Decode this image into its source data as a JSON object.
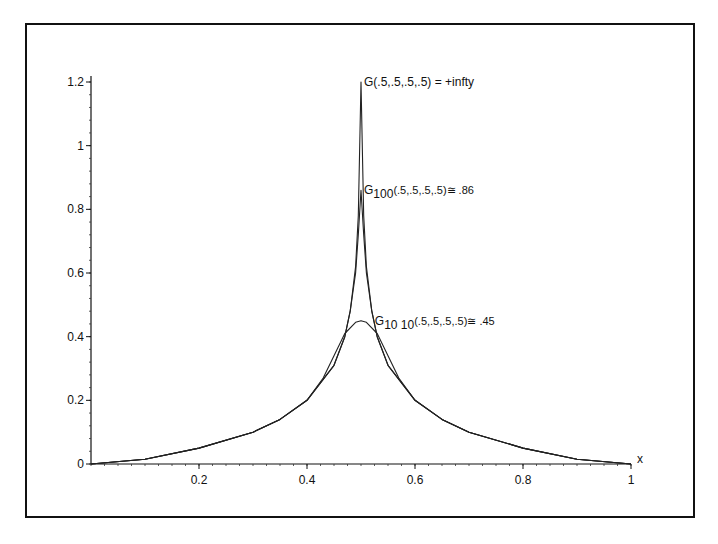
{
  "chart_data": {
    "type": "line",
    "title": "",
    "xlabel": "x",
    "ylabel": "",
    "xlim": [
      0,
      1
    ],
    "ylim": [
      0,
      1.2
    ],
    "grid": false,
    "x_ticks": [
      "0.2",
      "0.4",
      "0.6",
      "0.8",
      "1"
    ],
    "y_ticks": [
      "0",
      "0.2",
      "0.4",
      "0.6",
      "0.8",
      "1",
      "1.2"
    ],
    "annotations": [
      {
        "id": "g",
        "text": "G(.5,.5,.5,.5) = +infty",
        "x": 0.5,
        "y": 1.2
      },
      {
        "id": "g100",
        "prefix": "G",
        "sub": "100",
        "suffix": "(.5,.5,.5,.5)≅ .86",
        "x": 0.5,
        "y": 0.86
      },
      {
        "id": "g1010",
        "prefix": "G",
        "sub": "10 10",
        "suffix": "(.5,.5,.5,.5)≅ .45",
        "x": 0.52,
        "y": 0.45
      }
    ],
    "series": [
      {
        "name": "G",
        "x": [
          0,
          0.1,
          0.2,
          0.3,
          0.35,
          0.4,
          0.45,
          0.47,
          0.48,
          0.49,
          0.495,
          0.5,
          0.505,
          0.51,
          0.52,
          0.53,
          0.55,
          0.6,
          0.65,
          0.7,
          0.8,
          0.9,
          1
        ],
        "values": [
          0,
          0.015,
          0.05,
          0.1,
          0.14,
          0.2,
          0.31,
          0.4,
          0.48,
          0.62,
          0.78,
          1.2,
          0.78,
          0.62,
          0.48,
          0.4,
          0.31,
          0.2,
          0.14,
          0.1,
          0.05,
          0.015,
          0
        ]
      },
      {
        "name": "G100",
        "x": [
          0,
          0.1,
          0.2,
          0.3,
          0.35,
          0.4,
          0.45,
          0.47,
          0.48,
          0.49,
          0.495,
          0.5,
          0.505,
          0.51,
          0.52,
          0.53,
          0.55,
          0.6,
          0.65,
          0.7,
          0.8,
          0.9,
          1
        ],
        "values": [
          0,
          0.015,
          0.05,
          0.1,
          0.14,
          0.2,
          0.31,
          0.4,
          0.48,
          0.6,
          0.72,
          0.86,
          0.72,
          0.6,
          0.48,
          0.4,
          0.31,
          0.2,
          0.14,
          0.1,
          0.05,
          0.015,
          0
        ]
      },
      {
        "name": "G10 10",
        "x": [
          0,
          0.1,
          0.2,
          0.3,
          0.35,
          0.4,
          0.43,
          0.45,
          0.47,
          0.49,
          0.5,
          0.51,
          0.53,
          0.55,
          0.57,
          0.6,
          0.65,
          0.7,
          0.8,
          0.9,
          1
        ],
        "values": [
          0,
          0.015,
          0.05,
          0.1,
          0.14,
          0.2,
          0.27,
          0.34,
          0.41,
          0.445,
          0.45,
          0.445,
          0.41,
          0.34,
          0.27,
          0.2,
          0.14,
          0.1,
          0.05,
          0.015,
          0
        ]
      }
    ]
  }
}
